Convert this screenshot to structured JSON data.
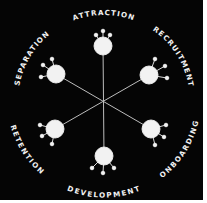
{
  "diagram": {
    "type": "employee-lifecycle-wheel",
    "colors": {
      "background": "#050505",
      "foreground": "#f2f2f2",
      "spoke": "#bdbdbd",
      "border": "#ffffff"
    },
    "stages": [
      {
        "id": "attraction",
        "label": "ATTRACTION"
      },
      {
        "id": "recruitment",
        "label": "RECRUITMENT"
      },
      {
        "id": "onboarding",
        "label": "ONBOARDING"
      },
      {
        "id": "development",
        "label": "DEVELOPMENT"
      },
      {
        "id": "retention",
        "label": "RETENTION"
      },
      {
        "id": "separation",
        "label": "SEPARATION"
      }
    ]
  }
}
